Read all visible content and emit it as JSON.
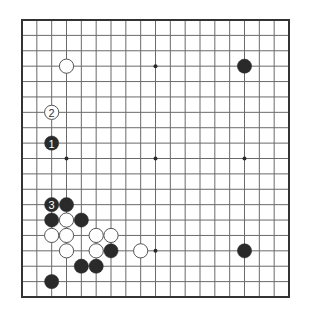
{
  "diagram": {
    "type": "go-board",
    "size": 19,
    "board": {
      "left": 22,
      "top": 20,
      "right": 289,
      "bottom": 297
    },
    "colors": {
      "background": "#ffffff",
      "grid_line": "#6a6a6a",
      "border": "#333333",
      "black_stone": "#2a2a2a",
      "white_stone_fill": "#ffffff",
      "white_stone_stroke": "#555555",
      "star_point": "#2a2a2a"
    },
    "star_points": [
      {
        "col": 3,
        "row": 3
      },
      {
        "col": 9,
        "row": 3
      },
      {
        "col": 15,
        "row": 3
      },
      {
        "col": 3,
        "row": 9
      },
      {
        "col": 9,
        "row": 9
      },
      {
        "col": 15,
        "row": 9
      },
      {
        "col": 3,
        "row": 15
      },
      {
        "col": 9,
        "row": 15
      },
      {
        "col": 15,
        "row": 15
      }
    ],
    "stones": [
      {
        "color": "white",
        "col": 3,
        "row": 3,
        "label": ""
      },
      {
        "color": "black",
        "col": 15,
        "row": 3,
        "label": ""
      },
      {
        "color": "white",
        "col": 2,
        "row": 6,
        "label": "2"
      },
      {
        "color": "black",
        "col": 2,
        "row": 8,
        "label": "1"
      },
      {
        "color": "black",
        "col": 2,
        "row": 12,
        "label": "3"
      },
      {
        "color": "black",
        "col": 3,
        "row": 12,
        "label": ""
      },
      {
        "color": "black",
        "col": 2,
        "row": 13,
        "label": ""
      },
      {
        "color": "white",
        "col": 3,
        "row": 13,
        "label": ""
      },
      {
        "color": "black",
        "col": 4,
        "row": 13,
        "label": ""
      },
      {
        "color": "white",
        "col": 2,
        "row": 14,
        "label": ""
      },
      {
        "color": "white",
        "col": 3,
        "row": 14,
        "label": ""
      },
      {
        "color": "white",
        "col": 5,
        "row": 14,
        "label": ""
      },
      {
        "color": "white",
        "col": 6,
        "row": 14,
        "label": ""
      },
      {
        "color": "white",
        "col": 3,
        "row": 15,
        "label": ""
      },
      {
        "color": "white",
        "col": 5,
        "row": 15,
        "label": ""
      },
      {
        "color": "black",
        "col": 6,
        "row": 15,
        "label": ""
      },
      {
        "color": "white",
        "col": 8,
        "row": 15,
        "label": ""
      },
      {
        "color": "black",
        "col": 15,
        "row": 15,
        "label": ""
      },
      {
        "color": "black",
        "col": 4,
        "row": 16,
        "label": ""
      },
      {
        "color": "black",
        "col": 5,
        "row": 16,
        "label": ""
      },
      {
        "color": "black",
        "col": 2,
        "row": 17,
        "label": ""
      }
    ]
  }
}
